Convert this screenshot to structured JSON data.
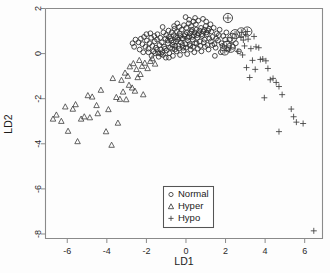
{
  "chart_data": {
    "type": "scatter",
    "title": "",
    "xlabel": "LD1",
    "ylabel": "LD2",
    "xlim": [
      -7.1,
      6.9
    ],
    "ylim": [
      -8.2,
      2.0
    ],
    "xticks": [
      -6,
      -4,
      -2,
      0,
      2,
      4,
      6
    ],
    "xticklabels": [
      "-6",
      "-4",
      "-2",
      "0",
      "2",
      "4",
      "6"
    ],
    "yticks": [
      2,
      0,
      -2,
      -4,
      -6,
      -8
    ],
    "yticklabels": [
      "2",
      "0",
      "-2",
      "-4",
      "-6",
      "-8"
    ],
    "grid": false,
    "legend_position": "bottom-center",
    "series": [
      {
        "name": "Normal",
        "marker": "circle",
        "points": [
          [
            -2.55,
            0.62
          ],
          [
            -2.4,
            0.5
          ],
          [
            -2.28,
            0.66
          ],
          [
            -2.2,
            0.42
          ],
          [
            -2.12,
            0.74
          ],
          [
            -2.05,
            0.3
          ],
          [
            -1.98,
            0.58
          ],
          [
            -1.9,
            0.22
          ],
          [
            -1.84,
            0.46
          ],
          [
            -1.76,
            0.7
          ],
          [
            -1.7,
            0.34
          ],
          [
            -1.64,
            0.1
          ],
          [
            -1.58,
            0.54
          ],
          [
            -1.52,
            0.26
          ],
          [
            -1.46,
            0.62
          ],
          [
            -1.4,
            0.02
          ],
          [
            -1.34,
            0.38
          ],
          [
            -1.28,
            0.18
          ],
          [
            -1.22,
            0.5
          ],
          [
            -1.16,
            -0.06
          ],
          [
            -1.1,
            0.3
          ],
          [
            -1.04,
            0.66
          ],
          [
            -0.98,
            0.14
          ],
          [
            -0.92,
            0.46
          ],
          [
            -0.86,
            0.74
          ],
          [
            -0.8,
            0.26
          ],
          [
            -0.74,
            0.58
          ],
          [
            -0.68,
            0.38
          ],
          [
            -0.62,
            0.82
          ],
          [
            -0.56,
            0.18
          ],
          [
            -0.5,
            0.54
          ],
          [
            -0.44,
            0.7
          ],
          [
            -0.38,
            0.34
          ],
          [
            -0.32,
            0.9
          ],
          [
            -0.26,
            0.5
          ],
          [
            -0.2,
            0.66
          ],
          [
            -0.14,
            0.26
          ],
          [
            -0.08,
            0.78
          ],
          [
            -0.02,
            0.42
          ],
          [
            0.04,
            0.94
          ],
          [
            0.1,
            0.58
          ],
          [
            0.16,
            0.74
          ],
          [
            0.22,
            0.34
          ],
          [
            0.28,
            0.98
          ],
          [
            0.34,
            0.62
          ],
          [
            0.4,
            0.82
          ],
          [
            0.46,
            0.46
          ],
          [
            0.52,
            1.06
          ],
          [
            0.58,
            0.7
          ],
          [
            0.64,
            0.9
          ],
          [
            0.7,
            0.54
          ],
          [
            0.76,
            1.14
          ],
          [
            0.82,
            0.78
          ],
          [
            0.88,
            0.98
          ],
          [
            0.94,
            0.62
          ],
          [
            1.0,
            1.22
          ],
          [
            1.06,
            0.86
          ],
          [
            1.12,
            1.02
          ],
          [
            1.18,
            0.66
          ],
          [
            1.24,
            1.3
          ],
          [
            -2.0,
            0.86
          ],
          [
            -1.8,
            0.9
          ],
          [
            -1.6,
            0.78
          ],
          [
            -1.44,
            0.86
          ],
          [
            -1.3,
            0.7
          ],
          [
            -1.14,
            0.94
          ],
          [
            -1.0,
            0.82
          ],
          [
            -0.88,
            1.02
          ],
          [
            -0.72,
            0.94
          ],
          [
            -0.58,
            1.1
          ],
          [
            -0.46,
            0.98
          ],
          [
            -0.34,
            1.18
          ],
          [
            -0.22,
            1.06
          ],
          [
            -0.1,
            1.26
          ],
          [
            0.02,
            1.14
          ],
          [
            0.14,
            1.34
          ],
          [
            0.26,
            1.22
          ],
          [
            0.38,
            1.42
          ],
          [
            0.5,
            1.3
          ],
          [
            0.62,
            1.46
          ],
          [
            -1.9,
            0.06
          ],
          [
            -1.74,
            -0.1
          ],
          [
            -1.56,
            0.02
          ],
          [
            -1.38,
            -0.14
          ],
          [
            -1.2,
            0.06
          ],
          [
            -1.02,
            -0.18
          ],
          [
            -0.84,
            0.02
          ],
          [
            -0.66,
            -0.1
          ],
          [
            -0.48,
            0.1
          ],
          [
            -0.3,
            -0.06
          ],
          [
            -0.12,
            0.14
          ],
          [
            0.06,
            -0.02
          ],
          [
            0.24,
            0.18
          ],
          [
            0.42,
            0.06
          ],
          [
            0.6,
            0.22
          ],
          [
            0.78,
            0.1
          ],
          [
            0.96,
            0.3
          ],
          [
            1.14,
            0.18
          ],
          [
            1.32,
            0.38
          ],
          [
            1.5,
            0.26
          ],
          [
            -0.92,
            0.58
          ],
          [
            -0.78,
            0.66
          ],
          [
            -0.64,
            0.5
          ],
          [
            -0.52,
            0.74
          ],
          [
            -0.4,
            0.62
          ],
          [
            -0.28,
            0.78
          ],
          [
            -0.16,
            0.66
          ],
          [
            -0.04,
            0.86
          ],
          [
            0.08,
            0.7
          ],
          [
            0.2,
            0.9
          ],
          [
            0.32,
            0.74
          ],
          [
            0.44,
            0.94
          ],
          [
            0.56,
            0.82
          ],
          [
            0.68,
            1.02
          ],
          [
            0.8,
            0.86
          ],
          [
            0.92,
            1.06
          ],
          [
            1.04,
            0.94
          ],
          [
            1.16,
            1.1
          ],
          [
            1.28,
            0.98
          ],
          [
            1.4,
            1.14
          ],
          [
            -0.7,
            0.22
          ],
          [
            -0.54,
            0.34
          ],
          [
            -0.36,
            0.22
          ],
          [
            -0.18,
            0.38
          ],
          [
            0.0,
            0.26
          ],
          [
            0.18,
            0.42
          ],
          [
            0.36,
            0.3
          ],
          [
            0.54,
            0.46
          ],
          [
            0.72,
            0.34
          ],
          [
            0.9,
            0.5
          ],
          [
            1.08,
            0.38
          ],
          [
            1.26,
            0.54
          ],
          [
            1.44,
            0.42
          ],
          [
            1.62,
            0.58
          ],
          [
            1.8,
            0.46
          ],
          [
            1.98,
            0.62
          ],
          [
            -2.62,
            0.3
          ],
          [
            -2.7,
            0.46
          ],
          [
            -2.34,
            0.18
          ],
          [
            -2.16,
            0.06
          ],
          [
            1.56,
            0.9
          ],
          [
            1.7,
            1.06
          ],
          [
            1.88,
            0.78
          ],
          [
            2.04,
            0.94
          ],
          [
            2.2,
            0.62
          ],
          [
            2.36,
            0.3
          ],
          [
            2.52,
            0.46
          ],
          [
            0.86,
            1.54
          ],
          [
            1.02,
            1.42
          ],
          [
            0.46,
            1.58
          ],
          [
            0.16,
            1.5
          ],
          [
            -0.02,
            1.62
          ],
          [
            2.68,
            0.1
          ],
          [
            2.1,
            0.18
          ],
          [
            1.46,
            -0.1
          ],
          [
            1.76,
            0.06
          ],
          [
            -1.46,
            0.18
          ],
          [
            -1.26,
            -0.02
          ],
          [
            -1.06,
            0.22
          ],
          [
            -0.86,
            -0.18
          ],
          [
            0.3,
            1.06
          ],
          [
            -0.44,
            1.34
          ],
          [
            -0.6,
            1.22
          ],
          [
            -1.18,
            1.18
          ],
          [
            1.34,
            0.74
          ],
          [
            1.52,
            0.66
          ],
          [
            1.66,
            0.82
          ],
          [
            1.84,
            0.34
          ]
        ]
      },
      {
        "name": "Normal-large-overlap",
        "marker": "circle-large",
        "points": [
          [
            2.12,
            1.58
          ],
          [
            2.48,
            0.86
          ],
          [
            2.8,
            0.94
          ],
          [
            3.1,
            0.98
          ],
          [
            2.34,
            0.7
          ],
          [
            2.06,
            0.34
          ],
          [
            2.26,
            0.26
          ],
          [
            1.96,
            0.14
          ]
        ]
      },
      {
        "name": "Hyper",
        "marker": "triangle",
        "points": [
          [
            -6.55,
            -2.72
          ],
          [
            -6.1,
            -2.36
          ],
          [
            -5.72,
            -2.46
          ],
          [
            -5.58,
            -2.26
          ],
          [
            -6.3,
            -3.0
          ],
          [
            -5.96,
            -3.44
          ],
          [
            -5.48,
            -3.9
          ],
          [
            -5.14,
            -2.8
          ],
          [
            -4.86,
            -2.84
          ],
          [
            -4.52,
            -2.3
          ],
          [
            -4.3,
            -1.62
          ],
          [
            -4.04,
            -3.46
          ],
          [
            -3.92,
            -2.48
          ],
          [
            -3.7,
            -1.1
          ],
          [
            -3.52,
            -1.94
          ],
          [
            -3.34,
            -2.02
          ],
          [
            -3.18,
            -1.7
          ],
          [
            -3.02,
            -2.04
          ],
          [
            -2.88,
            -1.4
          ],
          [
            -2.72,
            -1.52
          ],
          [
            -2.58,
            -1.66
          ],
          [
            -2.44,
            -1.06
          ],
          [
            -2.3,
            -0.92
          ],
          [
            -2.16,
            -1.82
          ],
          [
            -3.76,
            -4.06
          ],
          [
            -3.44,
            -3.08
          ],
          [
            -4.74,
            -1.92
          ],
          [
            -4.46,
            -2.66
          ],
          [
            -2.84,
            -0.58
          ],
          [
            -2.66,
            -0.44
          ],
          [
            -2.5,
            -0.7
          ],
          [
            -2.36,
            -0.3
          ],
          [
            -2.22,
            -0.56
          ],
          [
            -2.08,
            -0.42
          ],
          [
            -1.94,
            -0.66
          ],
          [
            -1.8,
            -0.34
          ],
          [
            -3.08,
            -0.86
          ],
          [
            -2.94,
            -1.0
          ],
          [
            -1.7,
            -0.22
          ],
          [
            -1.56,
            -0.46
          ],
          [
            -4.96,
            -1.86
          ],
          [
            -5.3,
            -2.9
          ],
          [
            -6.72,
            -2.9
          ],
          [
            -3.26,
            -1.18
          ]
        ]
      },
      {
        "name": "Hypo",
        "marker": "plus",
        "points": [
          [
            2.78,
            0.72
          ],
          [
            2.9,
            0.6
          ],
          [
            3.02,
            0.84
          ],
          [
            3.14,
            0.64
          ],
          [
            3.44,
            0.76
          ],
          [
            2.96,
            0.34
          ],
          [
            3.28,
            0.22
          ],
          [
            3.54,
            0.3
          ],
          [
            3.68,
            0.26
          ],
          [
            2.86,
            -0.06
          ],
          [
            3.36,
            -0.3
          ],
          [
            3.76,
            -0.26
          ],
          [
            3.88,
            -0.24
          ],
          [
            4.04,
            -0.32
          ],
          [
            3.5,
            -0.7
          ],
          [
            3.22,
            -1.06
          ],
          [
            4.26,
            -1.16
          ],
          [
            4.4,
            -1.1
          ],
          [
            4.56,
            -1.28
          ],
          [
            4.7,
            -1.46
          ],
          [
            3.96,
            -1.96
          ],
          [
            4.86,
            -1.82
          ],
          [
            5.32,
            -2.46
          ],
          [
            5.44,
            -2.8
          ],
          [
            5.58,
            -3.04
          ],
          [
            4.7,
            -3.46
          ],
          [
            6.46,
            -7.86
          ],
          [
            5.92,
            -3.1
          ],
          [
            4.14,
            -0.66
          ],
          [
            2.62,
            0.1
          ],
          [
            3.06,
            -0.62
          ]
        ]
      },
      {
        "name": "Hypo-circled",
        "marker": "plus-circled",
        "points": [
          [
            2.12,
            1.58
          ],
          [
            2.48,
            0.86
          ],
          [
            2.8,
            0.94
          ],
          [
            3.1,
            0.98
          ],
          [
            2.34,
            0.7
          ],
          [
            2.06,
            0.34
          ],
          [
            2.26,
            0.26
          ],
          [
            1.96,
            0.14
          ]
        ]
      }
    ],
    "legend": [
      {
        "label": "Normal",
        "marker": "circle"
      },
      {
        "label": "Hyper",
        "marker": "triangle"
      },
      {
        "label": "Hypo",
        "marker": "plus"
      }
    ]
  },
  "axes": {
    "x_title": "LD1",
    "y_title": "LD2"
  }
}
